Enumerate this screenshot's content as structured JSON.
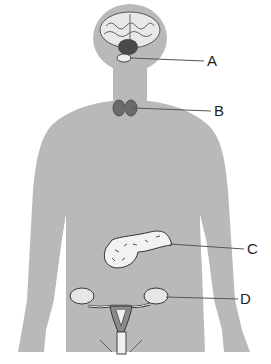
{
  "diagram": {
    "colors": {
      "body": "#b9b9b9",
      "gland_dark": "#4a4a4a",
      "gland_mid": "#7a7a7a",
      "organ_light": "#e6e6e6",
      "outline": "#333333",
      "leader_line": "#555555"
    },
    "labels": [
      {
        "id": "A",
        "text": "A",
        "points_to": "pituitary-region"
      },
      {
        "id": "B",
        "text": "B",
        "points_to": "thyroid"
      },
      {
        "id": "C",
        "text": "C",
        "points_to": "pancreas"
      },
      {
        "id": "D",
        "text": "D",
        "points_to": "ovary"
      }
    ]
  }
}
